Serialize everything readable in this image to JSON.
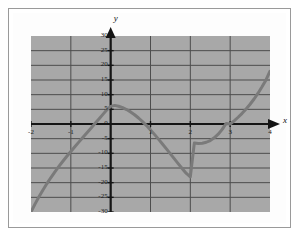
{
  "figure": {
    "background_color": "#ffffff",
    "plot_fill_color": "#a8a8a8",
    "grid_color": "#4d4d4d",
    "axis_color": "#151515",
    "curve_color": "#7a7a7a",
    "frame_color": "#9a9a9a"
  },
  "chart_data": {
    "type": "line",
    "title": "",
    "subtitle": "",
    "xlabel": "x",
    "ylabel": "y",
    "xlim": [
      -2,
      4
    ],
    "ylim": [
      -30,
      30
    ],
    "xticks": [
      -2,
      -1,
      0,
      1,
      2,
      3,
      4
    ],
    "xtick_labels": [
      "-2",
      "-1",
      "0",
      "1",
      "2",
      "3",
      "4"
    ],
    "yticks": [
      -30,
      -25,
      -20,
      -15,
      -10,
      -5,
      0,
      5,
      10,
      15,
      20,
      25,
      30
    ],
    "ytick_labels": [
      "-30",
      "-25",
      "-20",
      "-15",
      "-10",
      "-5",
      "0",
      "5",
      "10",
      "15",
      "20",
      "25",
      "30"
    ],
    "grid": true,
    "grid_x_step": 1,
    "grid_y_step": 5,
    "legend": null,
    "legend_position": "none",
    "x_axis_arrow": true,
    "y_axis_arrow": true,
    "series": [
      {
        "name": "cubic",
        "equation": "y = 2x^3 - 6x^2 - 2x + 6",
        "color": "#7a7a7a",
        "line_width": 3,
        "x": [
          -2.0,
          -1.9,
          -1.8,
          -1.7,
          -1.6,
          -1.5,
          -1.4,
          -1.3,
          -1.2,
          -1.1,
          -1.0,
          -0.9,
          -0.8,
          -0.7,
          -0.6,
          -0.5,
          -0.4,
          -0.3,
          -0.2,
          -0.1,
          0.0,
          0.1,
          0.2,
          0.3,
          0.4,
          0.5,
          0.6,
          0.7,
          0.8,
          0.9,
          1.0,
          1.1,
          1.2,
          1.3,
          1.4,
          1.5,
          1.6,
          1.7,
          1.8,
          1.9,
          2.0,
          2.1,
          2.2,
          2.3,
          2.4,
          2.5,
          2.6,
          2.7,
          2.8,
          2.9,
          3.0,
          3.1,
          3.2,
          3.3,
          3.4,
          3.5,
          3.6,
          3.7,
          3.8,
          3.9,
          4.0
        ],
        "y": [
          -30.0,
          -27.32,
          -24.82,
          -22.49,
          -20.31,
          -18.25,
          -16.31,
          -14.47,
          -12.7,
          -11.0,
          -9.36,
          -7.75,
          -6.18,
          -4.61,
          -3.05,
          -1.5,
          0.06,
          1.63,
          3.2,
          4.79,
          6.0,
          6.34,
          6.04,
          5.57,
          4.93,
          4.12,
          3.16,
          2.05,
          0.81,
          -0.54,
          -2.0,
          -3.54,
          -5.15,
          -6.8,
          -8.49,
          -10.19,
          -11.89,
          -13.58,
          -15.25,
          -16.86,
          -18.0,
          -6.5,
          -6.62,
          -6.54,
          -6.22,
          -5.63,
          -4.72,
          -3.47,
          -1.84,
          0.2,
          0.0,
          1.09,
          2.3,
          3.64,
          5.11,
          6.74,
          8.53,
          10.5,
          12.67,
          15.03,
          18.0
        ]
      }
    ],
    "key_points": {
      "roots": [
        -1,
        1,
        3
      ],
      "local_max": {
        "x": 0.1,
        "y": 6.3
      },
      "local_min": {
        "x": 2.2,
        "y": -6.6
      }
    }
  },
  "labels": {
    "y_axis_name": "y",
    "x_axis_name": "x"
  }
}
